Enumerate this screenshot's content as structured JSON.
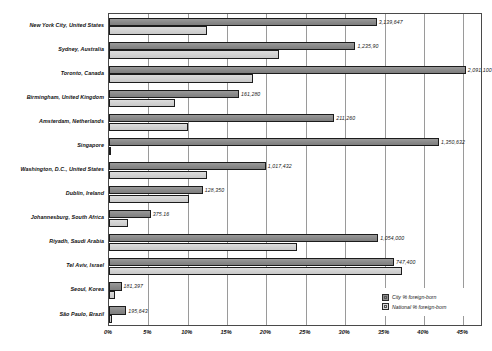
{
  "chart_data": {
    "type": "bar",
    "orientation": "horizontal",
    "title": "",
    "xlabel": "",
    "ylabel": "",
    "xlim": [
      0,
      47.5
    ],
    "grid": true,
    "legend_position": "bottom-right",
    "xticks": [
      "0%",
      "5%",
      "10%",
      "15%",
      "20%",
      "25%",
      "30%",
      "35%",
      "40%",
      "45%"
    ],
    "xtick_values": [
      0,
      5,
      10,
      15,
      20,
      25,
      30,
      35,
      40,
      45
    ],
    "categories": [
      "New York City, United States",
      "Sydney, Australia",
      "Toronto, Canada",
      "Birmingham, United Kingdom",
      "Amsterdam, Netherlands",
      "Singapore",
      "Washington, D.C., United States",
      "Dublin, Ireland",
      "Johannesburg, South Africa",
      "Riyadh, Saudi Arabia",
      "Tel Aviv, Israel",
      "Seoul, Korea",
      "São Paulo, Brazil"
    ],
    "series": [
      {
        "name": "City % foreign-born",
        "color": "#8e8e8e",
        "values": [
          34.0,
          31.3,
          45.3,
          16.5,
          28.6,
          41.9,
          19.9,
          11.9,
          5.3,
          34.2,
          36.2,
          1.6,
          2.2
        ]
      },
      {
        "name": "National % foreign-born",
        "color": "#d4d4d4",
        "values": [
          12.5,
          21.6,
          18.3,
          8.4,
          10.0,
          0.0,
          12.4,
          10.1,
          2.4,
          23.9,
          37.2,
          0.8,
          0.4
        ]
      }
    ],
    "point_labels": [
      "3,139,647",
      "1,235,90",
      "2,091,100",
      "161,280",
      "211,260",
      "1,350,632",
      "1,017,432",
      "128,350",
      "375.16",
      "1,054,000",
      "747,400",
      "181,397",
      "195,643"
    ],
    "legend": [
      {
        "label": "City % foreign-born",
        "swatch": "city"
      },
      {
        "label": "National % foreign-born",
        "swatch": "national"
      }
    ]
  }
}
